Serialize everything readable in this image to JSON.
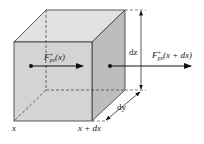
{
  "diagram": {
    "colors": {
      "front_face": "#d4d4d4",
      "top_face": "#e2e2e2",
      "right_face": "#bdbdbd",
      "edge": "#333333",
      "arrow": "#111111"
    },
    "labels": {
      "flux_in_main": "F",
      "flux_in_sup": "+",
      "flux_in_sub": "px",
      "flux_in_arg": "(x)",
      "flux_out_main": "F",
      "flux_out_sup": "+",
      "flux_out_sub": "px",
      "flux_out_arg": "(x + dx)",
      "dz": "dz",
      "dy": "dy",
      "x_left": "x",
      "x_right": "x + dx"
    }
  }
}
